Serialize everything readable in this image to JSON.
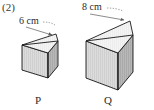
{
  "figure": {
    "item_number": "(2)",
    "background_color": "#ffffff",
    "ink_color": "#2b2b2b",
    "colors": {
      "outline": "#1a1a1a",
      "top_face": "#f2f2f2",
      "front_face": "#d8d8d8",
      "side_face": "#b3b3b3",
      "hidden_edge": "#8a8a8a",
      "leader_line": "#7d7d7d"
    },
    "solids": [
      {
        "id": "p",
        "label": "P",
        "shape": "triangular-prism",
        "dimension_label": "6 cm",
        "dimension_value": 6,
        "dimension_unit": "cm",
        "dimension_edge": "top-left-edge"
      },
      {
        "id": "q",
        "label": "Q",
        "shape": "triangular-prism",
        "dimension_label": "8 cm",
        "dimension_value": 8,
        "dimension_unit": "cm",
        "dimension_edge": "top-left-edge"
      }
    ]
  }
}
